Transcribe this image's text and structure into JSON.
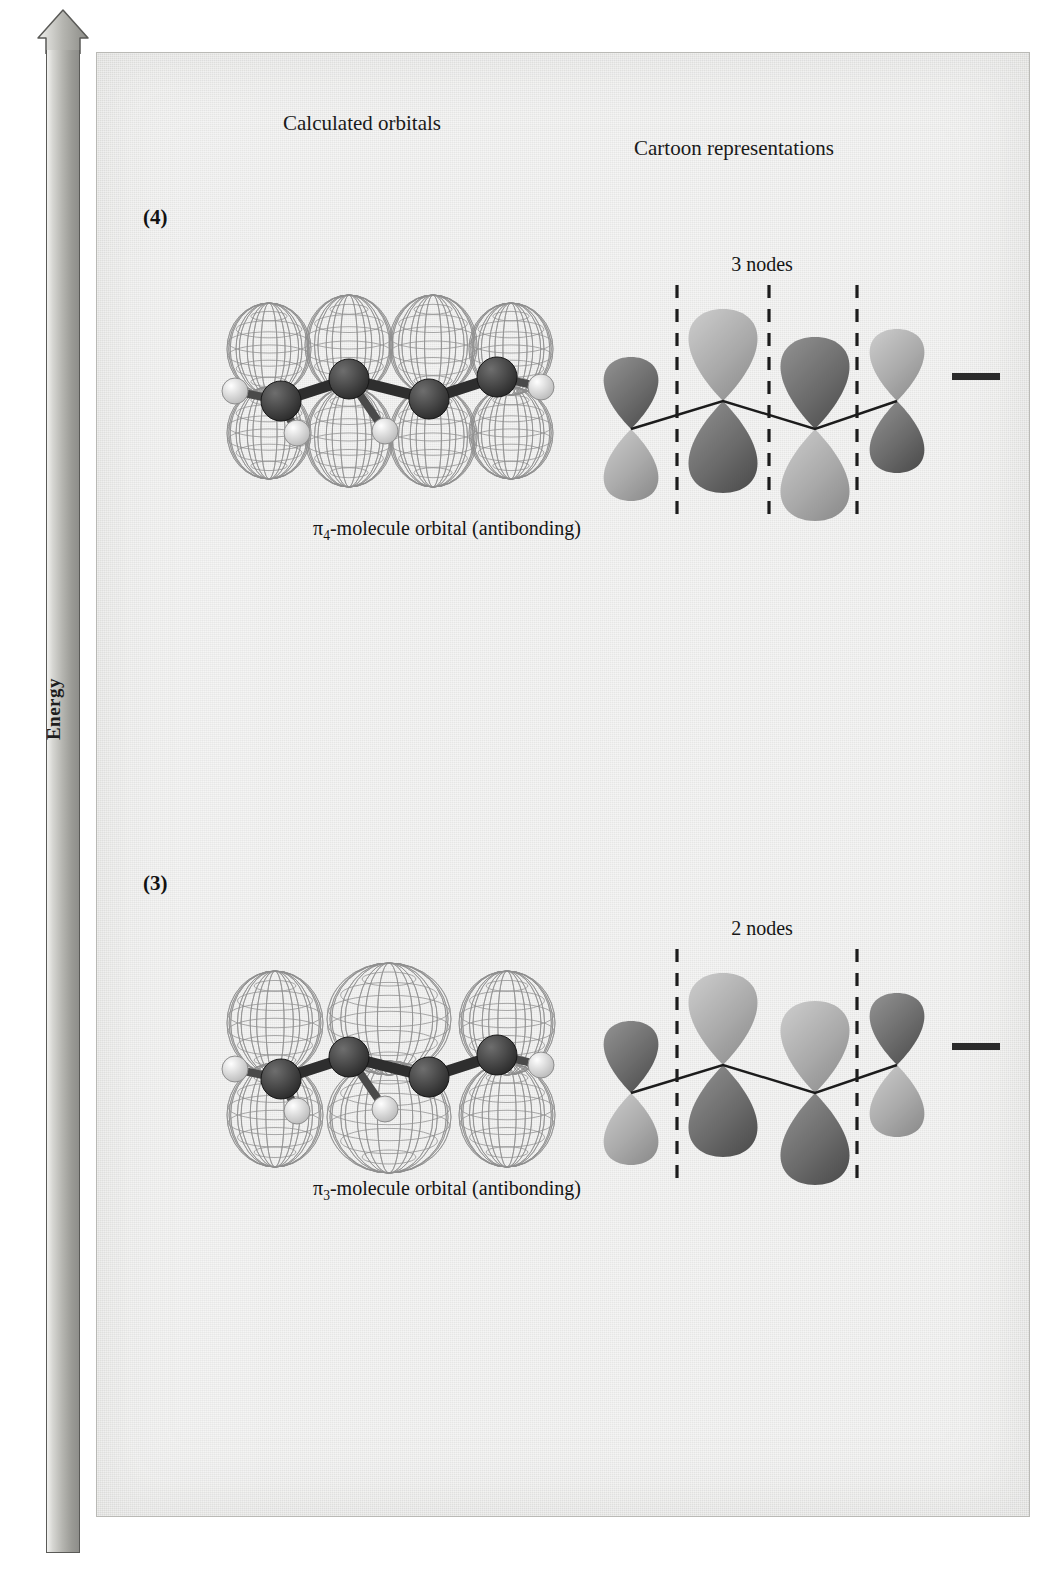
{
  "figure": {
    "energy_axis_label": "Energy",
    "energy_axis_direction": "up"
  },
  "columns": {
    "calculated_header": "Calculated orbitals",
    "cartoon_header": "Cartoon representations"
  },
  "colors": {
    "panel_background": "#ececeb",
    "ink": "#1a1a1a",
    "arrow_gray": "#b5b5b0",
    "lobe_dark": "#6e6e6e",
    "lobe_light": "#b6b6b6",
    "carbon": "#3a3a3a",
    "hydrogen": "#e8e8e8"
  },
  "levels": [
    {
      "number": "(4)",
      "caption_pi": "π",
      "caption_sub": "4",
      "caption_rest": "-molecule orbital (antibonding)",
      "caption_full": "π4-molecule orbital (antibonding)",
      "node_label": "3 nodes",
      "node_count": 3,
      "occupancy": "empty",
      "electrons": 0,
      "bonding": "antibonding",
      "phases": [
        1,
        -1,
        1,
        -1
      ]
    },
    {
      "number": "(3)",
      "caption_pi": "π",
      "caption_sub": "3",
      "caption_rest": "-molecule orbital (antibonding)",
      "caption_full": "π3-molecule orbital (antibonding)",
      "node_label": "2 nodes",
      "node_count": 2,
      "occupancy": "empty",
      "electrons": 0,
      "bonding": "antibonding",
      "phases": [
        1,
        -1,
        -1,
        1
      ]
    },
    {
      "number": "(2)",
      "caption_pi": "π",
      "caption_sub": "2",
      "caption_rest": "-molecule orbital (bonding)",
      "caption_full": "π2-molecule orbital (bonding)",
      "node_label": "1 node",
      "node_count": 1,
      "occupancy": "paired",
      "electrons": 2,
      "bonding": "bonding",
      "phases": [
        1,
        1,
        -1,
        -1
      ]
    },
    {
      "number": "(1)",
      "caption_pi": "π",
      "caption_sub": "1",
      "caption_rest": "-molecule orbital (bonding)",
      "caption_full": "π1-molecule orbital (bonding)",
      "node_label": "",
      "node_count": 0,
      "occupancy": "paired",
      "electrons": 2,
      "bonding": "bonding",
      "phases": [
        1,
        1,
        1,
        1
      ]
    }
  ]
}
